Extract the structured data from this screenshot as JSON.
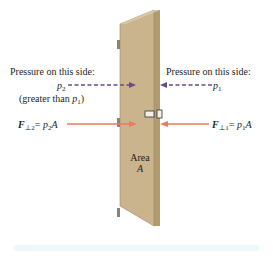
{
  "figure": {
    "left_side": {
      "pressure_heading": "Pressure on this side:",
      "pressure_symbol": "p",
      "pressure_subscript": "2",
      "note_prefix": "(greater than ",
      "note_symbol": "p",
      "note_subscript": "1",
      "note_suffix": ")",
      "force_symbol": "F",
      "force_subscript": "⊥2",
      "force_equals": "= ",
      "force_rhs_symbol": "p",
      "force_rhs_subscript": "2",
      "force_rhs_area": "A"
    },
    "right_side": {
      "pressure_heading": "Pressure on this side:",
      "pressure_symbol": "p",
      "pressure_subscript": "1",
      "force_symbol": "F",
      "force_subscript": "⊥1",
      "force_equals": "= ",
      "force_rhs_symbol": "p",
      "force_rhs_subscript": "1",
      "force_rhs_area": "A"
    },
    "door_label_line1": "Area",
    "door_label_line2": "A",
    "colors": {
      "door_face": "#c9b48d",
      "door_edge": "#b09a70",
      "pressure_arrow": "#6b4a87",
      "force_arrow": "#ec7a5e",
      "bottom_strip": "#eef8fb"
    }
  }
}
